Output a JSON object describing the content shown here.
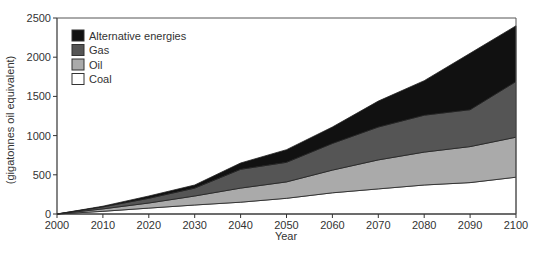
{
  "chart_data": {
    "type": "area",
    "stacked": true,
    "title": "",
    "xlabel": "Year",
    "ylabel": "(gigatonnes oil equivalent)",
    "xlim": [
      2000,
      2100
    ],
    "ylim": [
      0,
      2500
    ],
    "x": [
      2000,
      2010,
      2020,
      2030,
      2040,
      2050,
      2060,
      2070,
      2080,
      2090,
      2100
    ],
    "x_ticks": [
      "2000",
      "2010",
      "2020",
      "2030",
      "2040",
      "2050",
      "2060",
      "2070",
      "2080",
      "2090",
      "2100"
    ],
    "y_ticks": [
      "0",
      "500",
      "1000",
      "1500",
      "2000",
      "2500"
    ],
    "y_tick_values": [
      0,
      500,
      1000,
      1500,
      2000,
      2500
    ],
    "grid": false,
    "legend_position": "upper left",
    "series": [
      {
        "name": "Coal",
        "color": "#ffffff",
        "values": [
          0,
          35,
          75,
          115,
          150,
          200,
          270,
          320,
          370,
          400,
          470
        ]
      },
      {
        "name": "Oil",
        "color": "#aaaaaa",
        "values": [
          0,
          30,
          65,
          115,
          180,
          210,
          290,
          370,
          420,
          460,
          510
        ]
      },
      {
        "name": "Gas",
        "color": "#555555",
        "values": [
          0,
          25,
          60,
          100,
          240,
          250,
          340,
          420,
          470,
          470,
          710
        ]
      },
      {
        "name": "Alternative energies",
        "color": "#111111",
        "values": [
          0,
          10,
          30,
          40,
          80,
          160,
          210,
          330,
          440,
          720,
          710
        ]
      }
    ],
    "cumulative_tops": {
      "Coal": [
        0,
        35,
        75,
        115,
        150,
        200,
        270,
        320,
        370,
        400,
        470
      ],
      "Oil": [
        0,
        65,
        140,
        230,
        330,
        410,
        560,
        690,
        790,
        860,
        980
      ],
      "Gas": [
        0,
        90,
        200,
        330,
        570,
        660,
        900,
        1110,
        1260,
        1330,
        1690
      ],
      "Alternative energies": [
        0,
        100,
        230,
        370,
        650,
        820,
        1110,
        1440,
        1700,
        2050,
        2400
      ]
    }
  },
  "legend": {
    "items": [
      {
        "label": "Alternative energies",
        "color": "#111111"
      },
      {
        "label": "Gas",
        "color": "#555555"
      },
      {
        "label": "Oil",
        "color": "#aaaaaa"
      },
      {
        "label": "Coal",
        "color": "#ffffff"
      }
    ]
  },
  "axes": {
    "x_title": "Year",
    "y_title": "(gigatonnes oil equivalent)"
  }
}
